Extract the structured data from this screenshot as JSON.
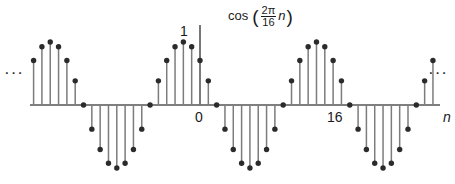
{
  "figure": {
    "title_parts": {
      "function": "cos",
      "open_paren": "(",
      "numerator": "2π",
      "denominator": "16",
      "variable": "n",
      "close_paren": ")"
    },
    "title_text": "cos (2π/16 n)",
    "ellipsis_left": "···",
    "ellipsis_right": "···",
    "axis": {
      "x_label": "n",
      "y_tick_label": "1",
      "x_tick_labels": [
        "0",
        "16"
      ]
    },
    "colors": {
      "stem": "#7c7c7c",
      "marker": "#2b2b2b",
      "axis": "#555555",
      "background": "#ffffff",
      "text": "#1a1a1a"
    }
  },
  "chart_data": {
    "type": "scatter",
    "subtype": "stem",
    "xlabel": "n",
    "ylabel": "",
    "formula": "x[n] = cos(2πn/16)",
    "period": 16,
    "amplitude": 1,
    "grid": false,
    "legend": null,
    "xlim": [
      -20.5,
      28.5
    ],
    "ylim": [
      -1.15,
      1.15
    ],
    "y_ticks": [
      1
    ],
    "x_ticks": [
      0,
      16
    ],
    "x": [
      -20,
      -19,
      -18,
      -17,
      -16,
      -15,
      -14,
      -13,
      -12,
      -11,
      -10,
      -9,
      -8,
      -7,
      -6,
      -5,
      -4,
      -3,
      -2,
      -1,
      0,
      1,
      2,
      3,
      4,
      5,
      6,
      7,
      8,
      9,
      10,
      11,
      12,
      13,
      14,
      15,
      16,
      17,
      18,
      19,
      20,
      21,
      22,
      23,
      24,
      25,
      26,
      27,
      28
    ],
    "values": [
      0.707,
      0.924,
      1.0,
      0.924,
      0.707,
      0.383,
      0.0,
      -0.383,
      -0.707,
      -0.924,
      -1.0,
      -0.924,
      -0.707,
      -0.383,
      0.0,
      0.383,
      0.707,
      0.924,
      1.0,
      0.924,
      0.707,
      0.383,
      0.0,
      -0.383,
      -0.707,
      -0.924,
      -1.0,
      -0.924,
      -0.707,
      -0.383,
      0.0,
      0.383,
      0.707,
      0.924,
      1.0,
      0.924,
      0.707,
      0.383,
      0.0,
      -0.383,
      -0.707,
      -0.924,
      -1.0,
      -0.924,
      -0.707,
      -0.383,
      0.0,
      0.383,
      0.707
    ],
    "annotations": [
      {
        "text": "···",
        "position": "left",
        "meaning": "signal continues to -∞"
      },
      {
        "text": "···",
        "position": "right",
        "meaning": "signal continues to +∞"
      }
    ]
  },
  "geometry": {
    "origin_px_x": 200,
    "baseline_px_y": 105,
    "sample_spacing_px": 8.32,
    "unit_amplitude_px": 63,
    "axis_start_px_x": 30,
    "axis_end_px_x": 440,
    "vertical_axis_top_px_y": 25
  }
}
